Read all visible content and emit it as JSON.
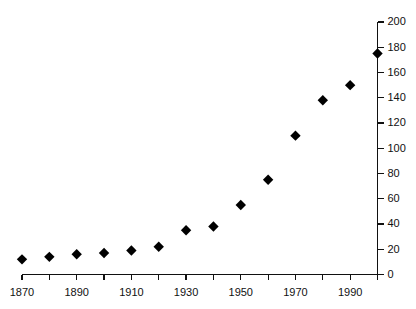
{
  "chart_data": {
    "type": "scatter",
    "title": "",
    "subtitle": "",
    "xlabel": "",
    "ylabel": "",
    "xlim": [
      1870,
      2000
    ],
    "ylim": [
      0,
      200
    ],
    "grid": false,
    "legend": null,
    "marker": "filled-diamond",
    "marker_color": "#000000",
    "x_tick_values": [
      1870,
      1880,
      1890,
      1900,
      1910,
      1920,
      1930,
      1940,
      1950,
      1960,
      1970,
      1980,
      1990,
      2000
    ],
    "x_tick_labels": [
      "1870",
      "",
      "1890",
      "",
      "1910",
      "",
      "1930",
      "",
      "1950",
      "",
      "1970",
      "",
      "1990",
      ""
    ],
    "y_tick_values": [
      0,
      20,
      40,
      60,
      80,
      100,
      120,
      140,
      160,
      180,
      200
    ],
    "y_tick_labels": [
      "0",
      "20",
      "40",
      "60",
      "80",
      "100",
      "120",
      "140",
      "160",
      "180",
      "200"
    ],
    "y_axis_position": "right",
    "x": [
      1870,
      1880,
      1890,
      1900,
      1910,
      1920,
      1930,
      1940,
      1950,
      1960,
      1970,
      1980,
      1990,
      2000
    ],
    "values": [
      12,
      14,
      16,
      17,
      19,
      22,
      35,
      38,
      55,
      75,
      110,
      138,
      150,
      175
    ],
    "points": [
      {
        "x": 1870,
        "y": 12
      },
      {
        "x": 1880,
        "y": 14
      },
      {
        "x": 1890,
        "y": 16
      },
      {
        "x": 1900,
        "y": 17
      },
      {
        "x": 1910,
        "y": 19
      },
      {
        "x": 1920,
        "y": 22
      },
      {
        "x": 1930,
        "y": 35
      },
      {
        "x": 1940,
        "y": 38
      },
      {
        "x": 1950,
        "y": 55
      },
      {
        "x": 1960,
        "y": 75
      },
      {
        "x": 1970,
        "y": 110
      },
      {
        "x": 1980,
        "y": 138
      },
      {
        "x": 1990,
        "y": 150
      },
      {
        "x": 2000,
        "y": 175
      }
    ]
  }
}
